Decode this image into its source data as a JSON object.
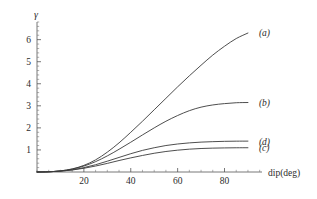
{
  "chart_data": {
    "type": "line",
    "title": "",
    "subtitle": "",
    "xlabel": "dip(deg)",
    "ylabel": "γ",
    "xlim": [
      0,
      96
    ],
    "ylim": [
      0,
      6.8
    ],
    "xticks": [
      20,
      40,
      60,
      80
    ],
    "xtick_labels": [
      "20",
      "40",
      "60",
      "80"
    ],
    "yticks": [
      1,
      2,
      3,
      4,
      5,
      6
    ],
    "ytick_labels": [
      "1",
      "2",
      "3",
      "4",
      "5",
      "6"
    ],
    "x_minor_step": 5,
    "y_minor_step": 0.2,
    "grid": false,
    "legend_position": "right-inline",
    "x": [
      0,
      5,
      10,
      15,
      20,
      25,
      30,
      35,
      40,
      45,
      50,
      55,
      60,
      65,
      70,
      75,
      80,
      85,
      90
    ],
    "series": [
      {
        "name": "(a)",
        "label": "(a)",
        "color": "#3a3a3a",
        "label_value": 6.3,
        "values": [
          0,
          0.01,
          0.05,
          0.14,
          0.3,
          0.55,
          0.9,
          1.32,
          1.8,
          2.3,
          2.82,
          3.34,
          3.86,
          4.36,
          4.84,
          5.3,
          5.7,
          6.05,
          6.3
        ]
      },
      {
        "name": "(b)",
        "label": "(b)",
        "color": "#3a3a3a",
        "label_value": 3.15,
        "values": [
          0,
          0.01,
          0.05,
          0.13,
          0.27,
          0.47,
          0.73,
          1.03,
          1.35,
          1.68,
          2.0,
          2.3,
          2.56,
          2.78,
          2.94,
          3.04,
          3.1,
          3.14,
          3.15
        ]
      },
      {
        "name": "(d)",
        "label": "(d)",
        "color": "#3a3a3a",
        "label_value": 1.4,
        "values": [
          0,
          0.01,
          0.04,
          0.1,
          0.2,
          0.33,
          0.49,
          0.66,
          0.83,
          0.98,
          1.1,
          1.2,
          1.27,
          1.32,
          1.355,
          1.375,
          1.39,
          1.398,
          1.4
        ]
      },
      {
        "name": "(c)",
        "label": "(c)",
        "color": "#3a3a3a",
        "label_value": 1.1,
        "values": [
          0,
          0.01,
          0.04,
          0.09,
          0.17,
          0.27,
          0.39,
          0.52,
          0.64,
          0.75,
          0.85,
          0.93,
          0.99,
          1.035,
          1.065,
          1.082,
          1.092,
          1.098,
          1.1
        ]
      }
    ]
  },
  "axes": {
    "x_axis_name": "x-axis",
    "y_axis_name": "y-axis"
  }
}
